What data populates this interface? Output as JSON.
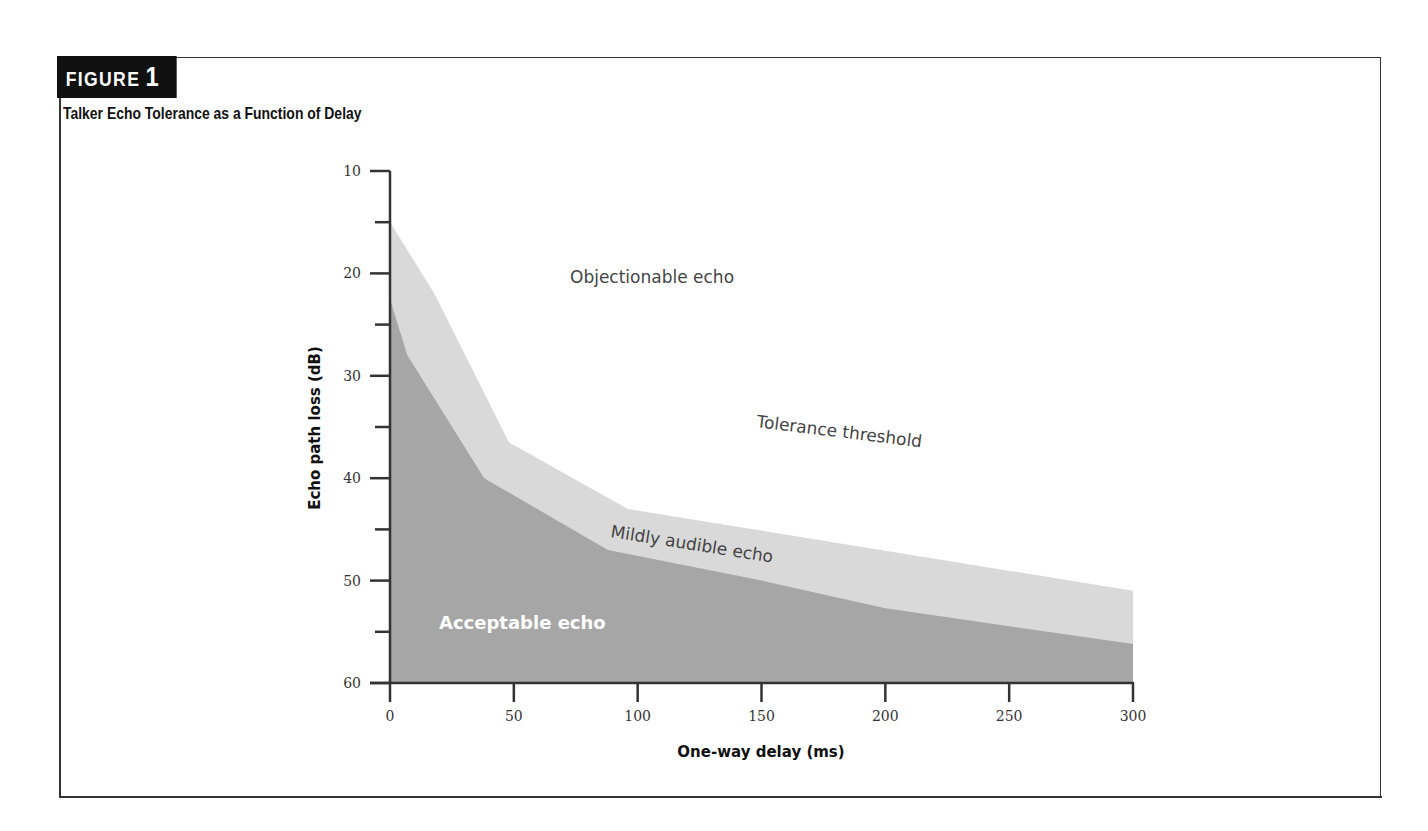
{
  "figure": {
    "tag_label": "FIGURE",
    "tag_number": "1",
    "title": "Talker Echo Tolerance as a Function of Delay"
  },
  "colors": {
    "frame": "#333333",
    "tag_bg": "#111111",
    "tolerance_region": "#d9d9d9",
    "acceptable_region": "#a6a6a6",
    "axis": "#333333"
  },
  "chart_data": {
    "type": "area",
    "title": "Talker Echo Tolerance as a Function of Delay",
    "xlabel": "One-way delay (ms)",
    "ylabel": "Echo path loss (dB)",
    "xlim": [
      0,
      300
    ],
    "ylim": [
      60,
      10
    ],
    "y_inverted": true,
    "x_ticks": [
      0,
      50,
      100,
      150,
      200,
      250,
      300
    ],
    "x_tick_labels": [
      "0",
      "50",
      "100",
      "150",
      "200",
      "250",
      "300"
    ],
    "y_ticks": [
      10,
      20,
      30,
      40,
      50,
      60
    ],
    "y_tick_labels": [
      "10",
      "20",
      "30",
      "40",
      "50",
      "60"
    ],
    "y_minor_ticks": [
      15,
      25,
      35,
      45,
      55
    ],
    "grid": false,
    "series": [
      {
        "name": "Tolerance threshold",
        "x": [
          0,
          18,
          48,
          96,
          300
        ],
        "y": [
          15,
          22,
          36.5,
          43,
          51
        ]
      },
      {
        "name": "Acceptable echo boundary",
        "x": [
          0,
          7,
          38,
          88,
          150,
          200,
          300
        ],
        "y": [
          22.5,
          28,
          40,
          47,
          50,
          52.7,
          56.2
        ]
      }
    ],
    "annotations": [
      {
        "text": "Objectionable echo",
        "x": 115,
        "y": 20
      },
      {
        "text": "Tolerance threshold",
        "x": 215,
        "y": 44.5
      },
      {
        "text": "Mildly audible echo",
        "x": 150,
        "y": 47.5
      },
      {
        "text": "Acceptable echo",
        "x": 35,
        "y": 55
      }
    ]
  }
}
